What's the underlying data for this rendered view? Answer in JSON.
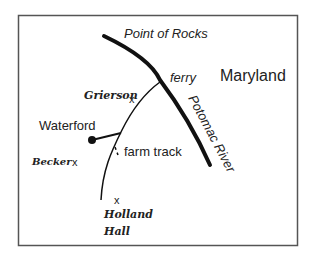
{
  "map": {
    "labels": {
      "point_of_rocks": "Point of Rocks",
      "ferry": "ferry",
      "maryland": "Maryland",
      "potomac_river": "Potomac River",
      "grierson": "Grierson",
      "waterford": "Waterford",
      "farm_track": "farm track",
      "becker": "Becker",
      "holland_hall_line1": "Holland",
      "holland_hall_line2": "Hall"
    },
    "markers": {
      "cross": "x"
    },
    "colors": {
      "ink": "#111111",
      "frame": "#555555",
      "background": "#ffffff"
    }
  }
}
